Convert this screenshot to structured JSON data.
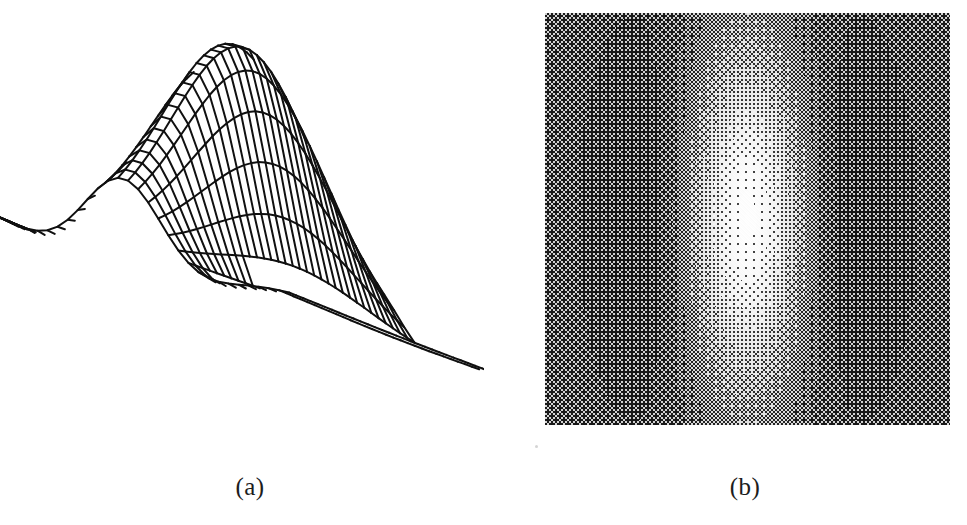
{
  "figure": {
    "background_color": "#ffffff",
    "ink_color": "#101010",
    "width": 967,
    "height": 525,
    "panels": [
      {
        "id": "a",
        "caption": "(a)",
        "kind": "3d-wireframe-mesh-surface",
        "description": "Mesh (wireframe) surface plot of a two-dimensional Gabor function: a cosine wave modulated by a Gaussian envelope, viewed in oblique projection with a tall central ridge flanked by two negative troughs."
      },
      {
        "id": "b",
        "caption": "(b)",
        "kind": "grayscale-halftone-image",
        "description": "The same two-dimensional Gabor function rendered as a halftone grayscale intensity image: a bright vertical central bar flanked by two dark vertical lobes on a mid-gray field.",
        "image_box": {
          "x": 545,
          "y": 13,
          "width": 405,
          "height": 412
        },
        "mid_gray": "#808080",
        "bright": "#ffffff",
        "dark": "#141414"
      }
    ]
  },
  "chart_data": {
    "type": "heatmap",
    "title": "",
    "subtitle": "",
    "xlabel": "",
    "ylabel": "",
    "zlabel": "",
    "grid": true,
    "legend": "none",
    "function": "Gabor: g(x,y) = exp(-(x^2/(2*sx^2) + y^2/(2*sy^2))) * cos(2*pi*f*x)",
    "parameters": {
      "sigma_x": 0.33,
      "sigma_y": 0.62,
      "frequency": 0.62,
      "phase": 0.0,
      "amplitude": 1.0
    },
    "xlim": [
      -1,
      1
    ],
    "ylim": [
      -1,
      1
    ],
    "zlim": [
      -0.45,
      1.0
    ],
    "grid_samples": {
      "nx": 34,
      "ny": 34
    },
    "view": {
      "azimuth": -37,
      "elevation": 28
    },
    "profile_x": [
      -1.0,
      -0.9,
      -0.8,
      -0.7,
      -0.6,
      -0.5,
      -0.4,
      -0.3,
      -0.2,
      -0.1,
      0.0,
      0.1,
      0.2,
      0.3,
      0.4,
      0.5,
      0.6,
      0.7,
      0.8,
      0.9,
      1.0
    ],
    "profile_center_row_values": [
      0.01,
      0.02,
      -0.02,
      -0.12,
      -0.27,
      -0.38,
      -0.33,
      -0.07,
      0.36,
      0.79,
      1.0,
      0.79,
      0.36,
      -0.07,
      -0.33,
      -0.38,
      -0.27,
      -0.12,
      -0.02,
      0.02,
      0.01
    ],
    "features": [
      {
        "name": "central-peak",
        "x": 0.0,
        "y": 0.0,
        "value": 1.0
      },
      {
        "name": "left-trough",
        "x": -0.5,
        "y": 0.0,
        "value": -0.38
      },
      {
        "name": "right-trough",
        "x": 0.5,
        "y": 0.0,
        "value": -0.38
      }
    ]
  }
}
